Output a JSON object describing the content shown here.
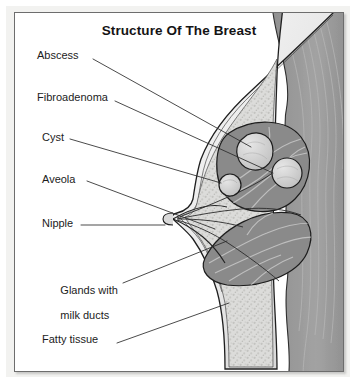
{
  "figure": {
    "title": "Structure Of The Breast",
    "kind": "anatomical-cross-section-illustration",
    "palette": {
      "background": "#ffffff",
      "paper_margin": "#f2f2f0",
      "frame_border": "#6d6d6d",
      "text": "#1c1c1c",
      "leader_line": "#2b2b2b",
      "skin": "#e4e4e4",
      "skin_outline": "#242424",
      "gland_tissue": "#8a8a8a",
      "gland_duct_highlight": "#c9c9c9",
      "fatty_tissue": "#d8d8d6",
      "mass_fill": "#d2d2d2",
      "chest_muscle": "#9a9a9a",
      "chest_muscle_striation": "#b4b4b4"
    },
    "labels": [
      {
        "id": "abscess",
        "text": "Abscess"
      },
      {
        "id": "fibroadenoma",
        "text": "Fibroadenoma"
      },
      {
        "id": "cyst",
        "text": "Cyst"
      },
      {
        "id": "aveola",
        "text": "Aveola"
      },
      {
        "id": "nipple",
        "text": "Nipple"
      },
      {
        "id": "glands",
        "line1": "Glands with",
        "line2": "milk ducts"
      },
      {
        "id": "fatty",
        "text": "Fatty tissue"
      }
    ]
  }
}
